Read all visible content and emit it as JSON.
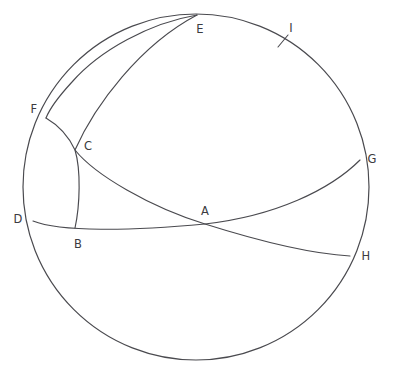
{
  "figure": {
    "type": "geometric-diagram",
    "background_color": "#ffffff",
    "stroke_color": "#4a4a4f",
    "canvas": {
      "width": 396,
      "height": 376
    }
  },
  "sphere": {
    "name": "outline-circle",
    "center_x": 196,
    "center_y": 187,
    "radius": 173
  },
  "points": [
    {
      "id": "A",
      "label": "A",
      "x": 205,
      "y": 224,
      "label_x": 205,
      "label_y": 212,
      "role": "intersection"
    },
    {
      "id": "B",
      "label": "B",
      "x": 75,
      "y": 228,
      "label_x": 78,
      "label_y": 245,
      "role": "endpoint"
    },
    {
      "id": "C",
      "label": "C",
      "x": 75,
      "y": 150,
      "label_x": 88,
      "label_y": 147,
      "role": "intersection"
    },
    {
      "id": "D",
      "label": "D",
      "x": 33,
      "y": 221,
      "label_x": 18,
      "label_y": 220,
      "role": "endpoint"
    },
    {
      "id": "E",
      "label": "E",
      "x": 197,
      "y": 15,
      "label_x": 200,
      "label_y": 30,
      "role": "endpoint"
    },
    {
      "id": "F",
      "label": "F",
      "x": 46,
      "y": 118,
      "label_x": 34,
      "label_y": 110,
      "role": "endpoint"
    },
    {
      "id": "G",
      "label": "G",
      "x": 360,
      "y": 160,
      "label_x": 372,
      "label_y": 160,
      "role": "endpoint"
    },
    {
      "id": "H",
      "label": "H",
      "x": 350,
      "y": 256,
      "label_x": 366,
      "label_y": 257,
      "role": "endpoint"
    },
    {
      "id": "I",
      "label": "I",
      "x": 283,
      "y": 41,
      "label_x": 291,
      "label_y": 29,
      "role": "tick-mark"
    }
  ],
  "curves": [
    {
      "id": "outline",
      "name": "sphere-outline-circle",
      "description": "Full circle outline of the sphere"
    },
    {
      "id": "D-B-A-G",
      "name": "equator-arc-d-a-g",
      "description": "Arc from D through B and A rising to G"
    },
    {
      "id": "E-C-A-H",
      "name": "great-circle-arc-e-c-a-h",
      "description": "Arc from E through C and A down to H"
    },
    {
      "id": "E-F",
      "name": "great-circle-arc-e-f",
      "description": "Arc from E curving left down to F"
    },
    {
      "id": "F-C-B",
      "name": "meridian-arc-f-c-b",
      "description": "Arc from F through C down to B"
    },
    {
      "id": "F-D",
      "name": "limb-arc-f-d",
      "description": "Left limb arc from F down to D"
    }
  ],
  "tick": {
    "name": "tick-mark-i",
    "x": 283,
    "y": 41,
    "length": 11,
    "angle_deg": 62
  }
}
